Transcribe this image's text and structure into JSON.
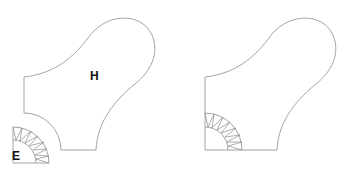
{
  "figure": {
    "panels": [
      {
        "id": "left",
        "shape_label": "H",
        "sector_label": "E",
        "description": "Shape H with a separate quarter-annulus sector E placed outside its lower-left concave corner"
      },
      {
        "id": "right",
        "shape_label": "",
        "sector_label": "",
        "description": "Same shape with the quarter-annulus sector fitted inside the lower-left corner"
      }
    ],
    "colors": {
      "outline": "#9a9a9a",
      "label": "#111111",
      "background": "#ffffff"
    }
  }
}
